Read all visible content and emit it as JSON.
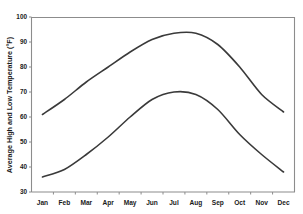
{
  "chart_data": {
    "type": "line",
    "title": "",
    "xlabel": "",
    "ylabel": "Average High and Low Temperature (°F)",
    "categories": [
      "Jan",
      "Feb",
      "Mar",
      "Apr",
      "May",
      "Jun",
      "Jul",
      "Aug",
      "Sep",
      "Oct",
      "Nov",
      "Dec"
    ],
    "ylim": [
      30,
      100
    ],
    "yticks": [
      30,
      40,
      50,
      60,
      70,
      80,
      90,
      100
    ],
    "ytick_labels": [
      "30",
      "40",
      "50",
      "60",
      "70",
      "80",
      "90",
      "100"
    ],
    "grid": false,
    "legend_position": "none",
    "series": [
      {
        "name": "Average High Temperature",
        "values": [
          61,
          67,
          74,
          80,
          86,
          91,
          93.5,
          93.5,
          89,
          80,
          69,
          62
        ]
      },
      {
        "name": "Average Low Temperature",
        "values": [
          36,
          39,
          45,
          52,
          60,
          67,
          70,
          69,
          63,
          53,
          45,
          38
        ]
      }
    ],
    "colors": {
      "line": "#3a3a3a",
      "axis": "#8c8c8c",
      "text": "#1a1a1a",
      "background": "#ffffff"
    }
  }
}
